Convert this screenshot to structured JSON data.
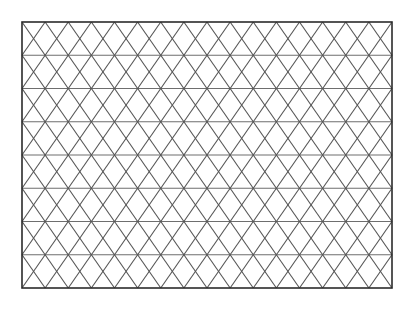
{
  "figure": {
    "type": "geometric-line-figure",
    "background_color": "#ffffff",
    "canvas": {
      "width": 414,
      "height": 310
    }
  },
  "frame": {
    "name": "outer-rectangle",
    "x": 22,
    "y": 22,
    "width": 370,
    "height": 266,
    "stroke_color": "#2b2b2b",
    "stroke_width": 1.6,
    "fill": "none"
  },
  "grid": {
    "description": "Isometric triangular lattice: horizontal rules plus two families of diagonals forming alternating up and down triangles.",
    "columns": 8,
    "rows": 8,
    "column_spacing": 46.25,
    "row_spacing": 33.25,
    "horizontal_line_color": "#6e6e6e",
    "horizontal_line_width": 1.2,
    "diagonal_line_color": "#555555",
    "diagonal_line_width": 1.1,
    "horizontal_y_values": [
      22,
      55.25,
      88.5,
      121.75,
      155,
      188.25,
      221.5,
      254.75,
      288
    ],
    "vertex_x_even_rows": [
      22,
      68.25,
      114.5,
      160.75,
      207,
      253.25,
      299.5,
      345.75,
      392
    ],
    "vertex_x_odd_rows": [
      22,
      45.125,
      91.375,
      137.625,
      183.875,
      230.125,
      276.375,
      322.625,
      368.875,
      392
    ],
    "half_offset": 23.125
  }
}
